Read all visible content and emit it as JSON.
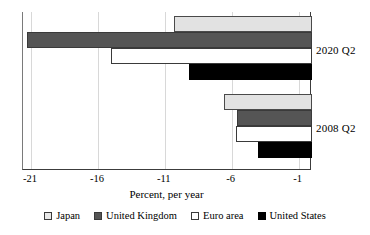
{
  "chart_data": {
    "type": "bar",
    "orientation": "horizontal",
    "title": "",
    "xlabel": "Percent, per year",
    "ylabel": "",
    "categories": [
      "2020 Q2",
      "2008 Q2"
    ],
    "series": [
      {
        "name": "Japan",
        "color": "#e2e2e2",
        "values": [
          -10.3,
          -6.6
        ]
      },
      {
        "name": "United Kingdom",
        "color": "#555555",
        "values": [
          -21.3,
          -5.6
        ]
      },
      {
        "name": "Euro area",
        "color": "#ffffff",
        "values": [
          -15.0,
          -5.7
        ]
      },
      {
        "name": "United States",
        "color": "#000000",
        "values": [
          -9.2,
          -4.0
        ]
      }
    ],
    "xlim": [
      -21.6,
      0
    ],
    "xticks": [
      -21,
      -16,
      -11,
      -6,
      -1
    ],
    "xtick_labels": [
      "-21",
      "-16",
      "-11",
      "-6",
      "-1"
    ],
    "grid": true,
    "legend_position": "bottom",
    "legend": [
      "Japan",
      "United Kingdom",
      "Euro area",
      "United States"
    ]
  }
}
